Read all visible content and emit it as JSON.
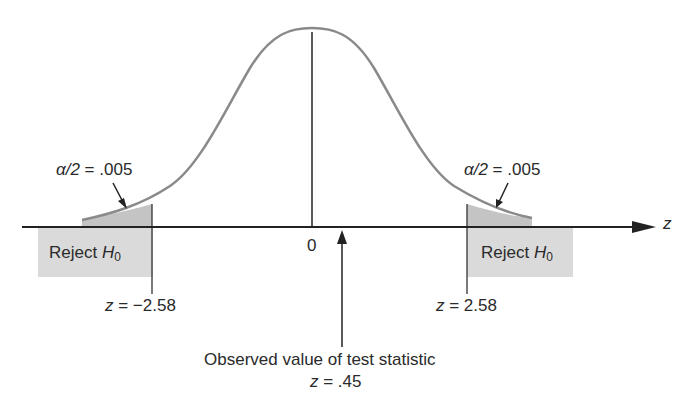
{
  "diagram": {
    "type": "two-tailed hypothesis test on standard normal curve",
    "axis_label": "z",
    "center_tick_label": "0",
    "left_tail": {
      "alpha_label_prefix": "α/2",
      "alpha_label_eq": " = .005",
      "reject_label": "Reject ",
      "reject_H": "H",
      "reject_sub": "0",
      "critical_prefix": "z",
      "critical_value": " = −2.58"
    },
    "right_tail": {
      "alpha_label_prefix": "α/2",
      "alpha_label_eq": " = .005",
      "reject_label": "Reject ",
      "reject_H": "H",
      "reject_sub": "0",
      "critical_prefix": "z",
      "critical_value": " = 2.58"
    },
    "observed": {
      "caption": "Observed value of test statistic",
      "value_prefix": "z",
      "value": " = .45"
    },
    "colors": {
      "curve": "#8a8a8a",
      "shade": "#d6d6d6",
      "tail_fill": "#b9b9b9",
      "axis": "#222222"
    }
  }
}
